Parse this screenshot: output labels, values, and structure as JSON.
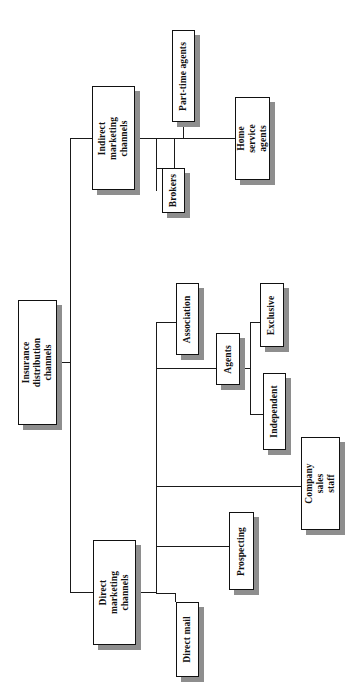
{
  "diagram": {
    "orientation": "rotated-90-ccw",
    "type": "tree",
    "nodes": [
      {
        "id": "root",
        "label": "Insurance\ndistribution channels",
        "level": 0
      },
      {
        "id": "indirect",
        "label": "Indirect marketing\nchannels",
        "level": 1
      },
      {
        "id": "direct",
        "label": "Direct marketing\nchannels",
        "level": 1
      },
      {
        "id": "parttime",
        "label": "Part-time agents",
        "level": 2
      },
      {
        "id": "brokers",
        "label": "Brokers",
        "level": 2
      },
      {
        "id": "homeservice",
        "label": "Home service\nagents",
        "level": 2
      },
      {
        "id": "association",
        "label": "Association",
        "level": 2
      },
      {
        "id": "agents",
        "label": "Agents",
        "level": 2
      },
      {
        "id": "companysales",
        "label": "Company sales\nstaff",
        "level": 2
      },
      {
        "id": "prospecting",
        "label": "Prospecting",
        "level": 2
      },
      {
        "id": "directmail",
        "label": "Direct mail",
        "level": 2
      },
      {
        "id": "exclusive",
        "label": "Exclusive",
        "level": 3
      },
      {
        "id": "independent",
        "label": "Independent",
        "level": 3
      }
    ],
    "edges": [
      {
        "from": "root",
        "to": "indirect"
      },
      {
        "from": "root",
        "to": "direct"
      },
      {
        "from": "indirect",
        "to": "parttime"
      },
      {
        "from": "indirect",
        "to": "brokers"
      },
      {
        "from": "indirect",
        "to": "homeservice"
      },
      {
        "from": "direct",
        "to": "association"
      },
      {
        "from": "direct",
        "to": "agents"
      },
      {
        "from": "direct",
        "to": "companysales"
      },
      {
        "from": "direct",
        "to": "prospecting"
      },
      {
        "from": "direct",
        "to": "directmail"
      },
      {
        "from": "agents",
        "to": "exclusive"
      },
      {
        "from": "agents",
        "to": "independent"
      }
    ],
    "colors": {
      "box_border": "#111111",
      "box_fill": "#ffffff",
      "shadow": "#8e8e8e",
      "line": "#1a1a1a",
      "text": "#111111",
      "page": "#ffffff"
    }
  }
}
